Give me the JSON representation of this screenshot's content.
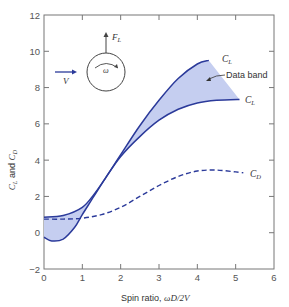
{
  "chart_data": {
    "type": "line",
    "title": "",
    "xlabel": "Spin ratio, ωD/2V",
    "xlabel_parts": {
      "prefix": "Spin ratio, ",
      "math": "ωD/2V"
    },
    "ylabel": "C_L and C_D",
    "xlim": [
      0,
      6
    ],
    "ylim": [
      -2,
      12
    ],
    "x_ticks": [
      0,
      1,
      2,
      3,
      4,
      5,
      6
    ],
    "y_ticks": [
      -2,
      0,
      2,
      4,
      6,
      8,
      10,
      12
    ],
    "x_tick_labels": [
      "0",
      "1",
      "2",
      "3",
      "4",
      "5",
      "6"
    ],
    "y_tick_labels": [
      "−2",
      "0",
      "2",
      "4",
      "6",
      "8",
      "10",
      "12"
    ],
    "grid": false,
    "series": [
      {
        "name": "C_L (upper bound of data band)",
        "style": "solid",
        "x": [
          0,
          0.5,
          1.0,
          1.3,
          1.6,
          2.0,
          2.5,
          3.0,
          3.5,
          4.0,
          4.3
        ],
        "values": [
          0.85,
          0.95,
          1.4,
          2.1,
          3.0,
          4.3,
          5.9,
          7.3,
          8.5,
          9.3,
          9.5
        ]
      },
      {
        "name": "C_L (lower bound of data band)",
        "style": "solid",
        "x": [
          0,
          0.2,
          0.5,
          0.8,
          1.0,
          1.3,
          1.6,
          2.0,
          2.5,
          3.0,
          3.5,
          4.0,
          4.5,
          5.1
        ],
        "values": [
          -0.25,
          -0.45,
          -0.35,
          0.3,
          1.0,
          2.0,
          3.0,
          4.2,
          5.3,
          6.2,
          6.8,
          7.15,
          7.3,
          7.35
        ]
      },
      {
        "name": "C_D",
        "style": "dashed",
        "x": [
          0,
          0.5,
          1.0,
          1.5,
          2.0,
          2.5,
          3.0,
          3.5,
          4.0,
          4.5,
          5.0,
          5.2
        ],
        "values": [
          0.75,
          0.75,
          0.8,
          1.0,
          1.4,
          2.0,
          2.6,
          3.1,
          3.4,
          3.45,
          3.35,
          3.3
        ]
      }
    ],
    "band": {
      "name": "Data band",
      "between": [
        "C_L (upper bound of data band)",
        "C_L (lower bound of data band)"
      ],
      "fill": "#c5cef0"
    },
    "annotations": [
      {
        "text": "C_L",
        "at_series": "upper"
      },
      {
        "text": "C_L",
        "at_series": "lower"
      },
      {
        "text": "C_D",
        "at_series": "cd"
      },
      {
        "text": "Data band",
        "arrow": true
      }
    ],
    "inset_diagram": {
      "velocity_label": "V",
      "lift_label": "F_L",
      "spin_label": "ω"
    },
    "colors": {
      "curve": "#2b3a9a",
      "band_fill": "#c5cef0",
      "axis": "#777777",
      "cd_dash": "#2b3a9a"
    }
  },
  "labels": {
    "cl_main": "C",
    "cl_sub": "L",
    "cd_main": "C",
    "cd_sub": "D",
    "data_band": "Data band",
    "v": "V",
    "fl_main": "F",
    "fl_sub": "L",
    "omega": "ω",
    "ylabel_and": " and ",
    "xlabel_prefix": "Spin ratio, ",
    "xlabel_math": "ωD/2V"
  }
}
